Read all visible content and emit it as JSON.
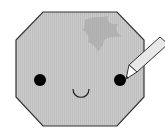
{
  "illustration": {
    "subject": "smiling octagon face with pencil",
    "colors": {
      "background": "#ffffff",
      "face_fill": "#c8c8c8",
      "face_stripe": "#bdbdbd",
      "outline": "#333333",
      "leaf": "#b0b0b0",
      "eyes": "#000000",
      "pencil_body": "#e6e6e6",
      "pencil_tip": "#ffffff"
    },
    "icons": [
      "octagon-face",
      "leaf-shadow-icon",
      "pencil-icon"
    ]
  }
}
